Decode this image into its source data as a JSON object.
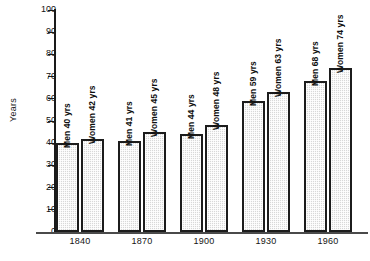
{
  "chart_data": {
    "type": "bar",
    "title": "",
    "subtitle": "",
    "xlabel": "",
    "ylabel": "Years",
    "ylim": [
      0,
      100
    ],
    "ytick_step": 10,
    "grid": false,
    "legend_position": "none",
    "orientation": "vertical",
    "categories": [
      "1840",
      "1870",
      "1900",
      "1930",
      "1960"
    ],
    "series": [
      {
        "name": "Men",
        "values": [
          40,
          41,
          44,
          59,
          68
        ]
      },
      {
        "name": "Women",
        "values": [
          42,
          45,
          48,
          63,
          74
        ]
      }
    ],
    "y_ticks": [
      {
        "value": 100,
        "label": "100"
      },
      {
        "value": 90,
        "label": "90"
      },
      {
        "value": 80,
        "label": "80"
      },
      {
        "value": 70,
        "label": "70"
      },
      {
        "value": 60,
        "label": "60"
      },
      {
        "value": 50,
        "label": "50"
      },
      {
        "value": 40,
        "label": "40"
      },
      {
        "value": 30,
        "label": "30"
      },
      {
        "value": 20,
        "label": "20"
      },
      {
        "value": 10,
        "label": "10"
      },
      {
        "value": 0,
        "label": "0"
      }
    ],
    "bars": [
      {
        "group": "1840",
        "series": "Men",
        "value": 40,
        "label": "Men 40 yrs"
      },
      {
        "group": "1840",
        "series": "Women",
        "value": 42,
        "label": "Women 42 yrs"
      },
      {
        "group": "1870",
        "series": "Men",
        "value": 41,
        "label": "Men 41 yrs"
      },
      {
        "group": "1870",
        "series": "Women",
        "value": 45,
        "label": "Women 45 yrs"
      },
      {
        "group": "1900",
        "series": "Men",
        "value": 44,
        "label": "Men 44 yrs"
      },
      {
        "group": "1900",
        "series": "Women",
        "value": 48,
        "label": "Women 48 yrs"
      },
      {
        "group": "1930",
        "series": "Men",
        "value": 59,
        "label": "Men 59 yrs"
      },
      {
        "group": "1930",
        "series": "Women",
        "value": 63,
        "label": "Women 63 yrs"
      },
      {
        "group": "1960",
        "series": "Men",
        "value": 68,
        "label": "Men 68 yrs"
      },
      {
        "group": "1960",
        "series": "Women",
        "value": 74,
        "label": "Women 74 yrs"
      }
    ],
    "colors": {
      "bar_fill": "#d8d8d8",
      "bar_stroke": "#1c1c1c",
      "axis": "#1a1a1a",
      "text": "#141414",
      "background": "#ffffff"
    }
  }
}
